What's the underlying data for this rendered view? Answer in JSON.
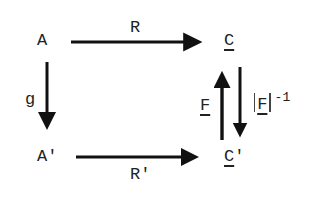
{
  "diagram": {
    "type": "commutative-diagram",
    "nodes": {
      "A": {
        "label": "A"
      },
      "C": {
        "label": "C",
        "underlined": true
      },
      "A_prime": {
        "label": "A'"
      },
      "C_prime": {
        "label": "C'",
        "underlined_part": "C",
        "suffix": "'"
      }
    },
    "edges": [
      {
        "id": "R",
        "from": "A",
        "to": "C",
        "label": "R"
      },
      {
        "id": "g",
        "from": "A",
        "to": "A_prime",
        "label": "g"
      },
      {
        "id": "R_prime",
        "from": "A_prime",
        "to": "C_prime",
        "label": "R'"
      },
      {
        "id": "F",
        "from": "C_prime",
        "to": "C",
        "label": "F",
        "underlined": true
      },
      {
        "id": "F_inv",
        "from": "C",
        "to": "C_prime",
        "label": "F",
        "abs_bars": true,
        "exponent": "-1"
      }
    ],
    "labels": {
      "A": "A",
      "C": "C",
      "A_prime": "A'",
      "C_prime_base": "C",
      "C_prime_mark": "'",
      "R": "R",
      "R_prime": "R'",
      "g": "g",
      "F": "F",
      "F_inv_base": "F",
      "F_inv_exp": "-1"
    },
    "ink_color": "#111111"
  }
}
